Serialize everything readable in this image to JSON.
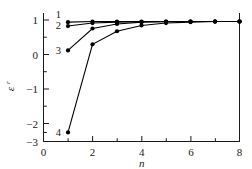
{
  "chart_data": {
    "type": "line",
    "title": "",
    "xlabel": "n",
    "ylabel": "ε",
    "ylabel_superscript": "r",
    "xlim": [
      0,
      8
    ],
    "ylim": [
      -3,
      1.35
    ],
    "xticks": [
      0,
      2,
      4,
      6,
      8
    ],
    "xticks_minor": [
      1,
      3,
      5,
      7
    ],
    "yticks": [
      1,
      0,
      -1,
      -2,
      -3
    ],
    "yticks_minor": [
      0.5,
      -0.5,
      -1.5,
      -2.5
    ],
    "xtick_labels": [
      "0",
      "2",
      "4",
      "6",
      "8"
    ],
    "ytick_labels": [
      "1",
      "0",
      "−1",
      "−2",
      "−3"
    ],
    "grid": false,
    "legend_position": "inline-left",
    "x": [
      1,
      2,
      3,
      4,
      5,
      6,
      7,
      8
    ],
    "series": [
      {
        "name": "1",
        "label": "1",
        "label_x": 1,
        "label_y": 1.18,
        "values": [
          0.93,
          0.95,
          0.95,
          0.95,
          0.95,
          0.95,
          0.95,
          0.95
        ]
      },
      {
        "name": "2",
        "label": "2",
        "label_x": 1,
        "label_y": 0.82,
        "values": [
          0.8,
          0.9,
          0.93,
          0.94,
          0.95,
          0.95,
          0.95,
          0.95
        ]
      },
      {
        "name": "3",
        "label": "3",
        "label_x": 1,
        "label_y": 0.0,
        "values": [
          0.0,
          0.72,
          0.87,
          0.93,
          0.94,
          0.95,
          0.95,
          0.95
        ]
      },
      {
        "name": "4",
        "label": "4",
        "label_x": 1,
        "label_y": -2.7,
        "values": [
          -2.7,
          0.2,
          0.63,
          0.82,
          0.9,
          0.93,
          0.95,
          0.95
        ]
      }
    ]
  },
  "figure": {
    "background_color": "#ffffff",
    "line_color": "#000000",
    "axis_color": "#1a1a1a"
  }
}
